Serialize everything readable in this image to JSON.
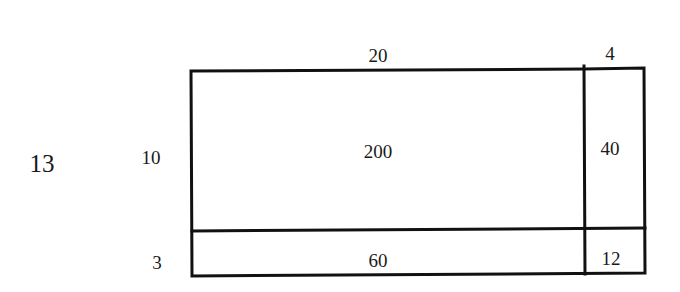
{
  "diagram": {
    "type": "area-model-multiplication",
    "factor_left": "13",
    "row_labels": [
      "10",
      "3"
    ],
    "column_labels": [
      "20",
      "4"
    ],
    "cells": [
      [
        "200",
        "40"
      ],
      [
        "60",
        "12"
      ]
    ],
    "line_color": "#111111"
  }
}
